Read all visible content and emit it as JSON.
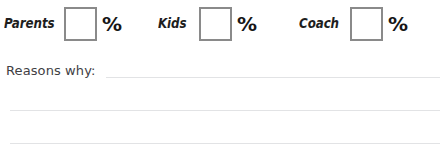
{
  "page": {
    "background_color": "#ffffff",
    "text_color": "#1e1e1e",
    "rule_color": "#e2e3e5",
    "box_border_color": "#8a8a8a"
  },
  "percentage_row": {
    "percent_sign": "%",
    "groups": [
      {
        "id": "parents",
        "label": "Parents",
        "value": "",
        "placeholder": "",
        "percent_sign": "%"
      },
      {
        "id": "kids",
        "label": "Kids",
        "value": "",
        "placeholder": "",
        "percent_sign": "%"
      },
      {
        "id": "coach",
        "label": "Coach",
        "value": "",
        "placeholder": "",
        "percent_sign": "%"
      }
    ]
  },
  "reasons": {
    "label": "Reasons why:",
    "lines": [
      "",
      "",
      ""
    ]
  }
}
